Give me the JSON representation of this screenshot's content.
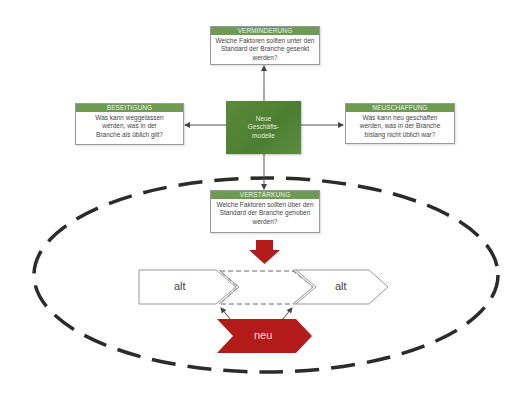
{
  "diagram": {
    "center": {
      "label": "Neue Geschäfts-modelle"
    },
    "boxes": {
      "top": {
        "title": "VERMINDERUNG",
        "text": "Welche Faktoren sollten unter den Standard der Branche gesenkt werden?"
      },
      "left": {
        "title": "BESEITIGUNG",
        "text": "Was kann weggelassen werden, was in der Branche als üblich gilt?"
      },
      "right": {
        "title": "NEUSCHAFFUNG",
        "text": "Was kann neu geschaffen werden, was in der Branche bislang nicht üblich war?"
      },
      "bottom": {
        "title": "VERSTÄRKUNG",
        "text": "Welche Faktoren sollten über den Standard der Branche gehoben werden?"
      }
    },
    "chain": {
      "left_label": "alt",
      "right_label": "alt",
      "new_label": "neu"
    },
    "colors": {
      "header_green": "#6e9a52",
      "center_green": "#4f8134",
      "accent_red": "#b31b1b",
      "ellipse": "#2b2b2b"
    }
  }
}
